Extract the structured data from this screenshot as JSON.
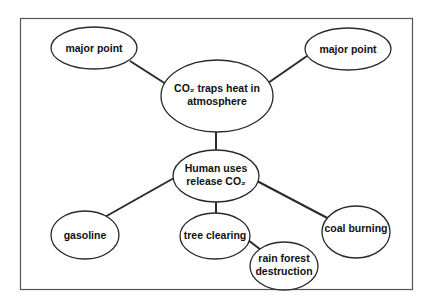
{
  "diagram": {
    "type": "concept-web",
    "colors": {
      "stroke": "#2a2a2a",
      "fill": "#ffffff",
      "frame": "#555555"
    },
    "nodes": [
      {
        "id": "central",
        "lines": [
          "CO₂ traps heat in",
          "atmosphere"
        ]
      },
      {
        "id": "major-left",
        "lines": [
          "major point"
        ]
      },
      {
        "id": "major-right",
        "lines": [
          "major point"
        ]
      },
      {
        "id": "human-uses",
        "lines": [
          "Human uses",
          "release CO₂"
        ]
      },
      {
        "id": "gasoline",
        "lines": [
          "gasoline"
        ]
      },
      {
        "id": "tree-clearing",
        "lines": [
          "tree clearing"
        ]
      },
      {
        "id": "coal-burning",
        "lines": [
          "coal burning"
        ]
      },
      {
        "id": "rain-forest",
        "lines": [
          "rain forest",
          "destruction"
        ]
      }
    ],
    "edges": [
      [
        "central",
        "major-left"
      ],
      [
        "central",
        "major-right"
      ],
      [
        "central",
        "human-uses"
      ],
      [
        "human-uses",
        "gasoline"
      ],
      [
        "human-uses",
        "tree-clearing"
      ],
      [
        "human-uses",
        "coal-burning"
      ],
      [
        "tree-clearing",
        "rain-forest"
      ]
    ]
  }
}
